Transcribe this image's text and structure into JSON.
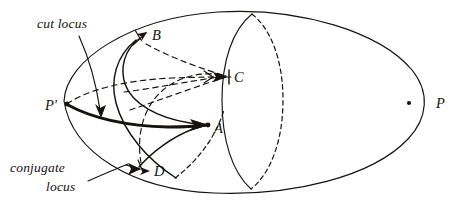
{
  "figure": {
    "ink_color": "#15120f",
    "background_color": "#ffffff",
    "width": 471,
    "height": 206,
    "annotations": {
      "cut_locus": "cut locus",
      "conjugate_locus_line1": "conjugate",
      "conjugate_locus_line2": "locus"
    },
    "points": [
      {
        "id": "P",
        "label": "P",
        "x": 409,
        "y": 103,
        "dot": true
      },
      {
        "id": "Pprime",
        "label": "P'",
        "x": 67,
        "y": 104,
        "dot": true
      },
      {
        "id": "A",
        "label": "A",
        "x": 208,
        "y": 125,
        "dot": true
      },
      {
        "id": "B",
        "label": "B",
        "x": 148,
        "y": 35,
        "dot": false
      },
      {
        "id": "C",
        "label": "C",
        "x": 229,
        "y": 77,
        "dot": true
      },
      {
        "id": "D",
        "label": "D",
        "x": 148,
        "y": 170,
        "dot": false
      }
    ],
    "label_positions": {
      "P": {
        "x": 436,
        "y": 108
      },
      "Pprime": {
        "x": 45,
        "y": 110
      },
      "A": {
        "x": 214,
        "y": 133
      },
      "B": {
        "x": 152,
        "y": 38
      },
      "C": {
        "x": 234,
        "y": 80
      },
      "D": {
        "x": 154,
        "y": 174
      },
      "cut_locus": {
        "x": 37,
        "y": 28
      },
      "conjugate_line1": {
        "x": 10,
        "y": 172
      },
      "conjugate_line2": {
        "x": 46,
        "y": 191
      }
    }
  }
}
